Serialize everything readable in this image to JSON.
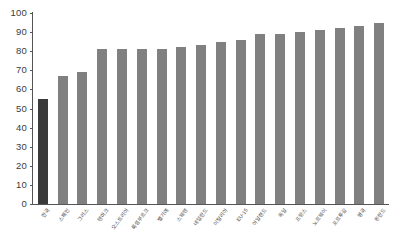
{
  "chart_data": {
    "type": "bar",
    "title": "",
    "subtitle": "",
    "xlabel": "",
    "ylabel": "",
    "ylim": [
      0,
      100
    ],
    "ytick_step": 10,
    "yticks": [
      100,
      90,
      80,
      70,
      60,
      50,
      40,
      30,
      20,
      10,
      0
    ],
    "grid": false,
    "legend": null,
    "bar_color": "#808080",
    "highlight_color": "#3a3a3a",
    "highlight_index": 0,
    "categories": [
      "한국",
      "스페인",
      "그리스",
      "덴마크",
      "오스트리아",
      "룩셈부르크",
      "벨기에",
      "스웨덴",
      "네덜란드",
      "이탈리아",
      "EU-15",
      "아일랜드",
      "독일",
      "프랑스",
      "노르웨이",
      "포르투갈",
      "영국",
      "핀란드"
    ],
    "values": [
      55,
      67,
      69,
      81,
      81,
      81,
      81,
      82,
      83,
      85,
      86,
      89,
      89,
      90,
      91,
      92,
      93,
      95
    ]
  }
}
